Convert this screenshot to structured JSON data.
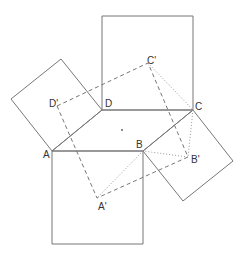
{
  "diagram": {
    "stroke_color": "#777777",
    "labels": {
      "A": "A",
      "B": "B",
      "C": "C",
      "D": "D",
      "A_prime": "A'",
      "B_prime": "B'",
      "C_prime": "C'",
      "D_prime": "D'"
    },
    "points": {
      "A": [
        52,
        151
      ],
      "B": [
        143,
        151
      ],
      "C": [
        193,
        110
      ],
      "D": [
        102,
        110
      ],
      "A_prime": [
        97,
        198
      ],
      "B_prime": [
        188,
        157
      ],
      "C_prime": [
        148,
        63
      ],
      "D_prime": [
        57,
        106
      ],
      "center": [
        122,
        130
      ]
    }
  }
}
